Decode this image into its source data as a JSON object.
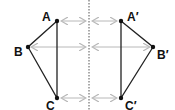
{
  "diagram": {
    "title": "",
    "mirror_line": {
      "x": 89,
      "y1": 0,
      "y2": 110,
      "style": "dotted",
      "color": "#555555"
    },
    "triangle_original": {
      "vertices": [
        {
          "label": "A",
          "x": 57,
          "y": 21
        },
        {
          "label": "B",
          "x": 28,
          "y": 47
        },
        {
          "label": "C",
          "x": 57,
          "y": 98
        }
      ],
      "edge_color": "#222222"
    },
    "triangle_image": {
      "vertices": [
        {
          "label": "A′",
          "x": 121,
          "y": 21
        },
        {
          "label": "B′",
          "x": 153,
          "y": 47
        },
        {
          "label": "C′",
          "x": 121,
          "y": 98
        }
      ],
      "edge_color": "#222222"
    },
    "arrow_color": "#b8b8b8",
    "labels": {
      "A": "A",
      "B": "B",
      "C": "C",
      "A_prime": "A′",
      "B_prime": "B′",
      "C_prime": "C′"
    }
  }
}
